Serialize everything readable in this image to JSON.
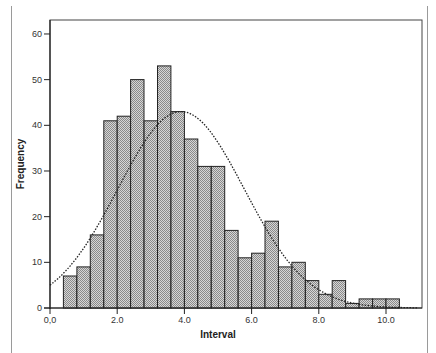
{
  "chart_data": {
    "type": "bar",
    "subtype": "histogram",
    "title": "",
    "xlabel": "Interval",
    "ylabel": "Frequency",
    "bin_width": 0.4,
    "bin_start": 0.4,
    "bins": [
      [
        0.4,
        0.8
      ],
      [
        0.8,
        1.2
      ],
      [
        1.2,
        1.6
      ],
      [
        1.6,
        2.0
      ],
      [
        2.0,
        2.4
      ],
      [
        2.4,
        2.8
      ],
      [
        2.8,
        3.2
      ],
      [
        3.2,
        3.6
      ],
      [
        3.6,
        4.0
      ],
      [
        4.0,
        4.4
      ],
      [
        4.4,
        4.8
      ],
      [
        4.8,
        5.2
      ],
      [
        5.2,
        5.6
      ],
      [
        5.6,
        6.0
      ],
      [
        6.0,
        6.4
      ],
      [
        6.4,
        6.8
      ],
      [
        6.8,
        7.2
      ],
      [
        7.2,
        7.6
      ],
      [
        7.6,
        8.0
      ],
      [
        8.0,
        8.4
      ],
      [
        8.4,
        8.8
      ],
      [
        8.8,
        9.2
      ],
      [
        9.2,
        9.6
      ],
      [
        9.6,
        10.0
      ],
      [
        10.0,
        10.4
      ]
    ],
    "values": [
      7,
      9,
      16,
      41,
      42,
      50,
      41,
      53,
      43,
      37,
      31,
      31,
      17,
      11,
      12,
      19,
      9,
      10,
      6,
      3,
      6,
      1,
      2,
      2,
      2
    ],
    "overlay": {
      "type": "normal-curve",
      "style": "dotted",
      "peak_x": 3.9,
      "peak_y": 43,
      "y_at_0": 5
    },
    "xlim": [
      0,
      11.1
    ],
    "ylim": [
      0,
      63
    ],
    "xticks": [
      0,
      2,
      4,
      6,
      8,
      10
    ],
    "xtick_labels": [
      "0,0",
      "2.0",
      "4.0",
      "6.0",
      "8.0",
      "10.0"
    ],
    "yticks": [
      0,
      10,
      20,
      30,
      40,
      50,
      60
    ],
    "ytick_labels": [
      "0",
      "10",
      "20",
      "30",
      "40",
      "50",
      "60"
    ],
    "grid": false,
    "legend": null,
    "colors": {
      "bar_fill": "#b8b8b8",
      "bar_edge": "#222222",
      "curve": "#222222",
      "axis": "#222222"
    }
  },
  "axes": {
    "x_title": "Interval",
    "y_title": "Frequency"
  }
}
